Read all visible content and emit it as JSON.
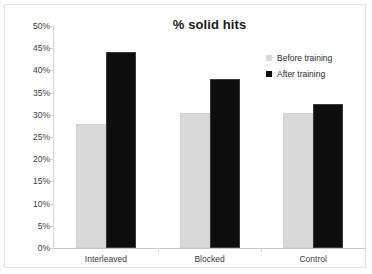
{
  "chart_data": {
    "type": "bar",
    "title": "% solid hits",
    "xlabel": "",
    "ylabel": "",
    "categories": [
      "Interleaved",
      "Blocked",
      "Control"
    ],
    "series": [
      {
        "name": "Before training",
        "color": "#d9d9d9",
        "values": [
          28,
          30.3,
          30.3
        ]
      },
      {
        "name": "After training",
        "color": "#0d0d0d",
        "values": [
          44.2,
          38,
          32.5
        ]
      }
    ],
    "ylim": [
      0,
      50
    ],
    "ytick_step": 5,
    "ytick_labels": [
      "50%",
      "45%",
      "40%",
      "35%",
      "30%",
      "25%",
      "20%",
      "15%",
      "10%",
      "5%",
      "0%"
    ],
    "ytick_values": [
      50,
      45,
      40,
      35,
      30,
      25,
      20,
      15,
      10,
      5,
      0
    ],
    "grid": false,
    "legend_position": "top-right",
    "value_format": "percent"
  },
  "legend": {
    "items": [
      {
        "label": "Before training",
        "marker": "legend-swatch-before"
      },
      {
        "label": "After training",
        "marker": "legend-swatch-after"
      }
    ]
  }
}
